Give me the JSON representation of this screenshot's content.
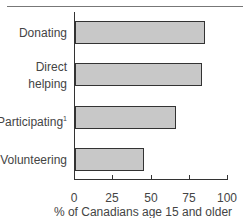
{
  "chart_data": {
    "type": "bar",
    "orientation": "horizontal",
    "categories": [
      "Donating",
      "Direct helping",
      "Participating¹",
      "Volunteering"
    ],
    "values": [
      85,
      83,
      66,
      45
    ],
    "title": "",
    "xlabel": "% of Canadians age 15 and older",
    "ylabel": "",
    "xlim": [
      0,
      100
    ],
    "xticks": [
      "0",
      "25",
      "50",
      "75",
      "100"
    ],
    "grid": false,
    "legend": null
  },
  "labels": {
    "donating": "Donating",
    "direct": "Direct",
    "helping": "helping",
    "participating": "Participating",
    "participating_sup": "1",
    "volunteering": "Volunteering"
  },
  "ticks": [
    "0",
    "25",
    "50",
    "75",
    "100"
  ],
  "xlabel": "% of Canadians age 15 and older"
}
